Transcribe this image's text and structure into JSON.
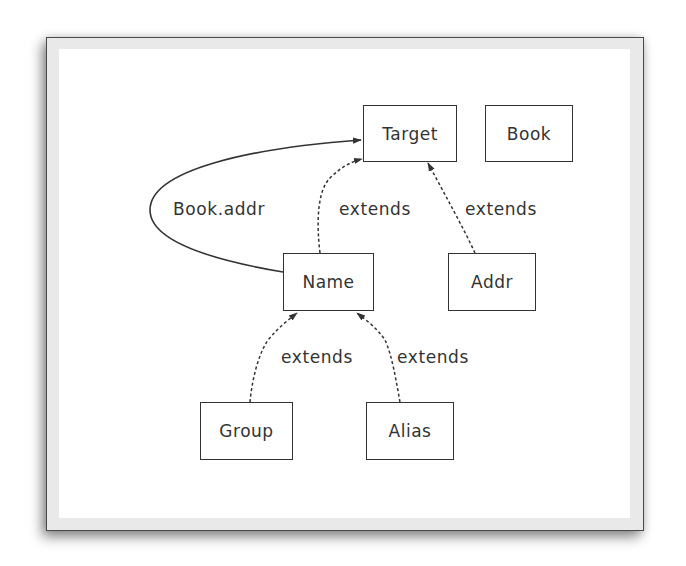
{
  "diagram": {
    "type": "class-relationship-graph",
    "colors": {
      "frame_border": "#4a4a4a",
      "frame_fill": "#e9e9e9",
      "canvas": "#ffffff",
      "node_border": "#333333",
      "text": "#333333",
      "edge": "#333333"
    },
    "nodes": [
      {
        "id": "target",
        "label": "Target"
      },
      {
        "id": "book",
        "label": "Book"
      },
      {
        "id": "name",
        "label": "Name"
      },
      {
        "id": "addr",
        "label": "Addr"
      },
      {
        "id": "group",
        "label": "Group"
      },
      {
        "id": "alias",
        "label": "Alias"
      }
    ],
    "edges": [
      {
        "from": "name",
        "to": "target",
        "label": "Book.addr",
        "style": "solid"
      },
      {
        "from": "name",
        "to": "target",
        "label": "extends",
        "style": "dashed"
      },
      {
        "from": "addr",
        "to": "target",
        "label": "extends",
        "style": "dashed"
      },
      {
        "from": "group",
        "to": "name",
        "label": "extends",
        "style": "dashed"
      },
      {
        "from": "alias",
        "to": "name",
        "label": "extends",
        "style": "dashed"
      }
    ]
  }
}
